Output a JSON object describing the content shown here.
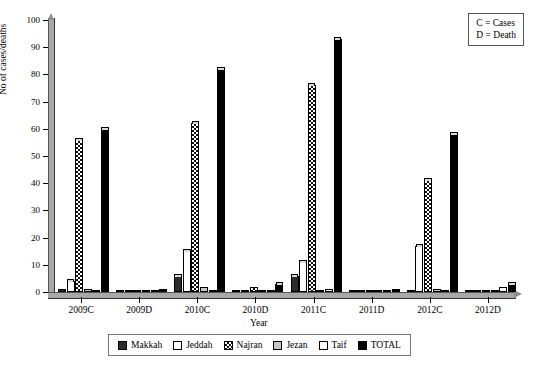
{
  "chart_data": {
    "type": "bar",
    "title": "",
    "xlabel": "Year",
    "ylabel": "No of cases/deaths",
    "ylim": [
      0,
      100
    ],
    "yticks": [
      0,
      10,
      20,
      30,
      40,
      50,
      60,
      70,
      80,
      90,
      100
    ],
    "grid": false,
    "legend_position": "bottom",
    "categories": [
      "2009C",
      "2009D",
      "2010C",
      "2010D",
      "2011C",
      "2011D",
      "2012C",
      "2012D"
    ],
    "series": [
      {
        "name": "Makkah",
        "color": "#2b2b2b",
        "pattern": "solid-dark",
        "values": [
          1,
          0,
          6,
          0,
          6,
          0,
          0,
          0
        ]
      },
      {
        "name": "Jeddah",
        "color": "#ffffff",
        "pattern": "fine-dotted",
        "values": [
          4,
          0,
          15,
          0,
          11,
          0,
          17,
          0
        ]
      },
      {
        "name": "Najran",
        "color": "#ffffff",
        "pattern": "checkerboard",
        "values": [
          56,
          0,
          62,
          2,
          76,
          0,
          41,
          0
        ]
      },
      {
        "name": "Jezan",
        "color": "#c6c6c6",
        "pattern": "solid-grey",
        "values": [
          1,
          0,
          2,
          0,
          0,
          0,
          1,
          0
        ]
      },
      {
        "name": "Taif",
        "color": "#ffffff",
        "pattern": "solid-white",
        "values": [
          0,
          0,
          0,
          0,
          1,
          0,
          0,
          2
        ]
      },
      {
        "name": "TOTAL",
        "color": "#000000",
        "pattern": "solid-black",
        "values": [
          60,
          1,
          82,
          3,
          93,
          1,
          58,
          3
        ]
      }
    ],
    "annotations": [
      "C = Cases",
      "D = Death"
    ]
  },
  "annotation_box": {
    "line1": "C = Cases",
    "line2": "D = Death"
  },
  "axes": {
    "ylabel": "No of cases/deaths",
    "xlabel": "Year",
    "ytick_labels": [
      "0",
      "10",
      "20",
      "30",
      "40",
      "50",
      "60",
      "70",
      "80",
      "90",
      "100"
    ],
    "xtick_labels": [
      "2009C",
      "2009D",
      "2010C",
      "2010D",
      "2011C",
      "2011D",
      "2012C",
      "2012D"
    ]
  },
  "legend": {
    "items": [
      {
        "label": "Makkah"
      },
      {
        "label": "Jeddah"
      },
      {
        "label": "Najran"
      },
      {
        "label": "Jezan"
      },
      {
        "label": "Taif"
      },
      {
        "label": "TOTAL"
      }
    ]
  }
}
